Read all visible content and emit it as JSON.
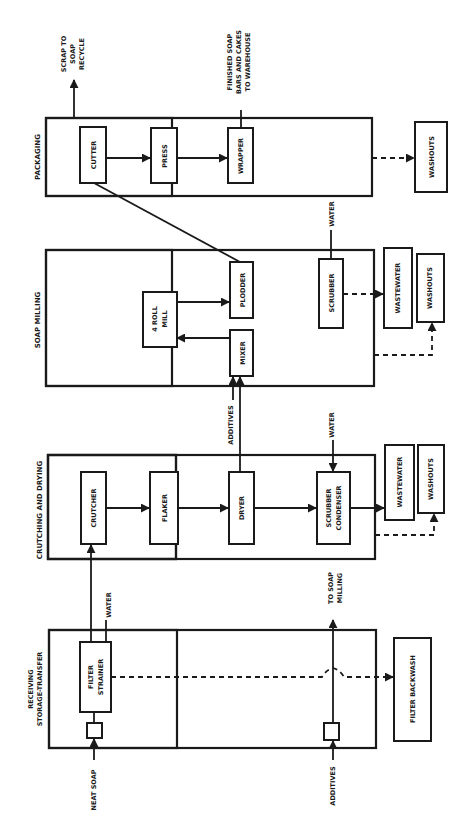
{
  "diagram": {
    "type": "process flow diagram (rotated 90° counter-clockwise)",
    "colors": {
      "ink": "#1a1a1a",
      "background": "#ffffff"
    },
    "sections": {
      "receiving": {
        "label_line1": "RECEIVING",
        "label_line2": "STORAGE-TRANSFER"
      },
      "crutching": {
        "label": "CRUTCHING AND DRYING"
      },
      "milling": {
        "label": "SOAP MILLING"
      },
      "packaging": {
        "label": "PACKAGING"
      }
    },
    "units": {
      "filter_strainer": {
        "line1": "FILTER",
        "line2": "STRAINER"
      },
      "crutcher": "CRUTCHER",
      "flaker": "FLAKER",
      "dryer": "DRYER",
      "scrubber_condenser": {
        "line1": "SCRUBBER",
        "line2": "CONDENSER"
      },
      "wastewater_1": "WASTEWATER",
      "washouts_1": "WASHOUTS",
      "four_roll_mill": {
        "line1": "4 ROLL",
        "line2": "MILL"
      },
      "mixer": "MIXER",
      "plodder": "PLODDER",
      "scrubber": "SCRUBBER",
      "wastewater_2": "WASTEWATER",
      "washouts_2": "WASHOUTS",
      "cutter": "CUTTER",
      "press": "PRESS",
      "wrapper": "WRAPPER",
      "washouts_3": "WASHOUTS",
      "filter_backwash": "FILTER BACKWASH"
    },
    "streams": {
      "neat_soap": "NEAT SOAP",
      "additives_in": "ADDITIVES",
      "water_receiving": "WATER",
      "to_soap_milling": {
        "line1": "TO SOAP",
        "line2": "MILLING"
      },
      "water_crutching": "WATER",
      "additives_milling": "ADDITIVES",
      "water_milling": "WATER",
      "scrap": {
        "line1": "SCRAP TO",
        "line2": "SOAP",
        "line3": "RECYCLE"
      },
      "finished": {
        "line1": "FINISHED SOAP",
        "line2": "BARS AND CAKES",
        "line3": "TO WAREHOUSE"
      }
    }
  }
}
